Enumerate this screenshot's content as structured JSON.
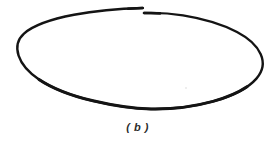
{
  "figure": {
    "caption": "( b )",
    "label_letter": "b",
    "background_color": "#ffffff",
    "stroke_color": "#141414",
    "canvas": {
      "width": 275,
      "height": 145
    },
    "shape": {
      "type": "open-ellipse",
      "description": "hand-drawn open ellipse with offset gap at top",
      "center_x": 140,
      "center_y": 60,
      "radius_x": 122,
      "radius_y": 50,
      "tilt_degrees": -1.5,
      "stroke_width_min": 1.8,
      "stroke_width_max": 3.0,
      "gap": {
        "upper_end_x": 142,
        "upper_end_y": 8,
        "lower_start_x": 144,
        "lower_start_y": 13,
        "vertical_offset": 5
      },
      "extents": {
        "left_x": 17,
        "right_x": 262,
        "top_y": 7,
        "bottom_y": 109
      }
    },
    "artifacts": [
      {
        "name": "scan-speck",
        "x": 185,
        "y": 87,
        "size": 2
      }
    ]
  }
}
